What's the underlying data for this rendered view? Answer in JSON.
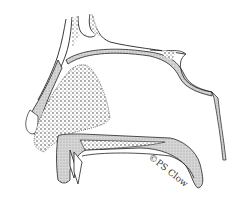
{
  "figure": {
    "signature": "©PS Clow",
    "colors": {
      "line": "#222222",
      "stipple_fill": "#cfcfcf",
      "background": "#ffffff"
    }
  }
}
